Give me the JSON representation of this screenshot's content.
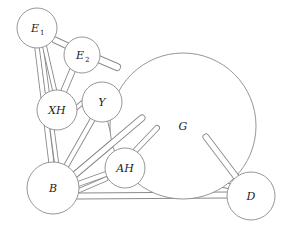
{
  "diagram": {
    "title": "",
    "nodes": [
      {
        "id": "E1",
        "label": "E",
        "subscript": "1",
        "cx": 37,
        "cy": 28,
        "r": 20
      },
      {
        "id": "E2",
        "label": "E",
        "subscript": "2",
        "cx": 82,
        "cy": 55,
        "r": 18
      },
      {
        "id": "XH",
        "label": "XH",
        "subscript": "",
        "cx": 57,
        "cy": 110,
        "r": 20
      },
      {
        "id": "Y",
        "label": "Y",
        "subscript": "",
        "cx": 102,
        "cy": 102,
        "r": 20
      },
      {
        "id": "G",
        "label": "G",
        "subscript": "",
        "cx": 183,
        "cy": 126,
        "r": 73
      },
      {
        "id": "AH",
        "label": "AH",
        "subscript": "",
        "cx": 125,
        "cy": 168,
        "r": 20
      },
      {
        "id": "B",
        "label": "B",
        "subscript": "",
        "cx": 53,
        "cy": 188,
        "r": 26
      },
      {
        "id": "D",
        "label": "D",
        "subscript": "",
        "cx": 251,
        "cy": 196,
        "r": 24
      }
    ],
    "sticks": [
      {
        "from": "E1",
        "x1": 37,
        "y1": 45,
        "x2": 52,
        "y2": 168,
        "w": 6
      },
      {
        "from": "E1",
        "x1": 41,
        "y1": 45,
        "x2": 57,
        "y2": 166,
        "w": 5
      },
      {
        "from": "E1",
        "x1": 44,
        "y1": 44,
        "x2": 55,
        "y2": 92,
        "w": 5
      },
      {
        "from": "E1",
        "x1": 55,
        "y1": 40,
        "x2": 72,
        "y2": 48,
        "w": 7
      },
      {
        "from": "E2",
        "x1": 76,
        "y1": 62,
        "x2": 63,
        "y2": 93,
        "w": 7
      },
      {
        "from": "E2",
        "x1": 96,
        "y1": 58,
        "x2": 117,
        "y2": 67,
        "w": 8
      },
      {
        "from": "Y",
        "x1": 121,
        "y1": 97,
        "x2": 137,
        "y2": 97,
        "w": 6
      },
      {
        "from": "Y",
        "x1": 82,
        "y1": 103,
        "x2": 76,
        "y2": 108,
        "w": 5
      },
      {
        "from": "Y",
        "x1": 94,
        "y1": 117,
        "x2": 65,
        "y2": 168,
        "w": 6
      },
      {
        "from": "Y",
        "x1": 110,
        "y1": 120,
        "x2": 117,
        "y2": 148,
        "w": 6
      },
      {
        "from": "G",
        "x1": 142,
        "y1": 118,
        "x2": 71,
        "y2": 178,
        "w": 7
      },
      {
        "from": "G",
        "x1": 157,
        "y1": 128,
        "x2": 136,
        "y2": 150,
        "w": 6
      },
      {
        "from": "AH",
        "x1": 106,
        "y1": 174,
        "x2": 78,
        "y2": 184,
        "w": 6
      },
      {
        "from": "AH",
        "x1": 106,
        "y1": 179,
        "x2": 78,
        "y2": 191,
        "w": 5
      },
      {
        "from": "AH",
        "x1": 144,
        "y1": 172,
        "x2": 229,
        "y2": 186,
        "w": 6
      },
      {
        "from": "B",
        "x1": 78,
        "y1": 196,
        "x2": 228,
        "y2": 195,
        "w": 7
      },
      {
        "from": "D",
        "x1": 206,
        "y1": 137,
        "x2": 237,
        "y2": 178,
        "w": 7
      }
    ]
  }
}
